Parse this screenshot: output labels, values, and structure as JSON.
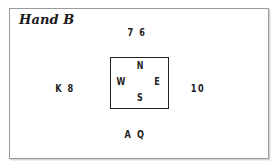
{
  "diagram": {
    "title": "Hand B",
    "type": "bridge-hand-diagram",
    "compass": {
      "north": "N",
      "east": "E",
      "south": "S",
      "west": "W"
    },
    "hands": {
      "north": "7 6",
      "west": "K 8",
      "east": "10",
      "south": "A Q"
    }
  }
}
